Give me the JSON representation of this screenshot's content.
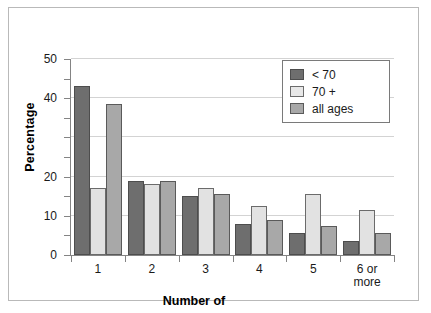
{
  "chart_data": {
    "type": "bar",
    "title": "",
    "xlabel": "Number of",
    "ylabel": "Percentage",
    "categories": [
      "1",
      "2",
      "3",
      "4",
      "5",
      "6 or\nmore"
    ],
    "category_labels": [
      {
        "line1": "1",
        "line2": ""
      },
      {
        "line1": "2",
        "line2": ""
      },
      {
        "line1": "3",
        "line2": ""
      },
      {
        "line1": "4",
        "line2": ""
      },
      {
        "line1": "5",
        "line2": ""
      },
      {
        "line1": "6 or",
        "line2": "more"
      }
    ],
    "series": [
      {
        "name": "< 70",
        "color": "#6e6e6e",
        "values": [
          43,
          19,
          15,
          8,
          5.5,
          3.5
        ]
      },
      {
        "name": "70 +",
        "color": "#e2e2e2",
        "values": [
          17,
          18,
          17,
          12.5,
          15.5,
          11.5
        ]
      },
      {
        "name": "all ages",
        "color": "#a8a8a8",
        "values": [
          38.5,
          19,
          15.5,
          9,
          7.5,
          5.5
        ]
      }
    ],
    "ylim": [
      0,
      50
    ],
    "y_ticks": [
      0,
      5,
      10,
      15,
      20,
      25,
      30,
      35,
      40,
      45,
      50
    ],
    "y_tick_labels": [
      {
        "value": 50,
        "label": "50"
      },
      {
        "value": 45,
        "label": ""
      },
      {
        "value": 40,
        "label": "40"
      },
      {
        "value": 35,
        "label": ""
      },
      {
        "value": 30,
        "label": ""
      },
      {
        "value": 25,
        "label": ""
      },
      {
        "value": 20,
        "label": "20"
      },
      {
        "value": 15,
        "label": ""
      },
      {
        "value": 10,
        "label": "10"
      },
      {
        "value": 5,
        "label": ""
      },
      {
        "value": 0,
        "label": "0"
      }
    ],
    "gridlines": [
      50,
      40,
      30,
      20,
      10
    ],
    "grid": true,
    "legend_position": "top-right",
    "legend_entries": [
      "< 70",
      "70 +",
      "all ages"
    ]
  },
  "colors": {
    "series_dark": "#6e6e6e",
    "series_light": "#e2e2e2",
    "series_mid": "#a8a8a8",
    "gridline": "#d3d3d3",
    "axis": "#848484",
    "frame": "#b9b9b9",
    "text": "#1a1a1a"
  }
}
